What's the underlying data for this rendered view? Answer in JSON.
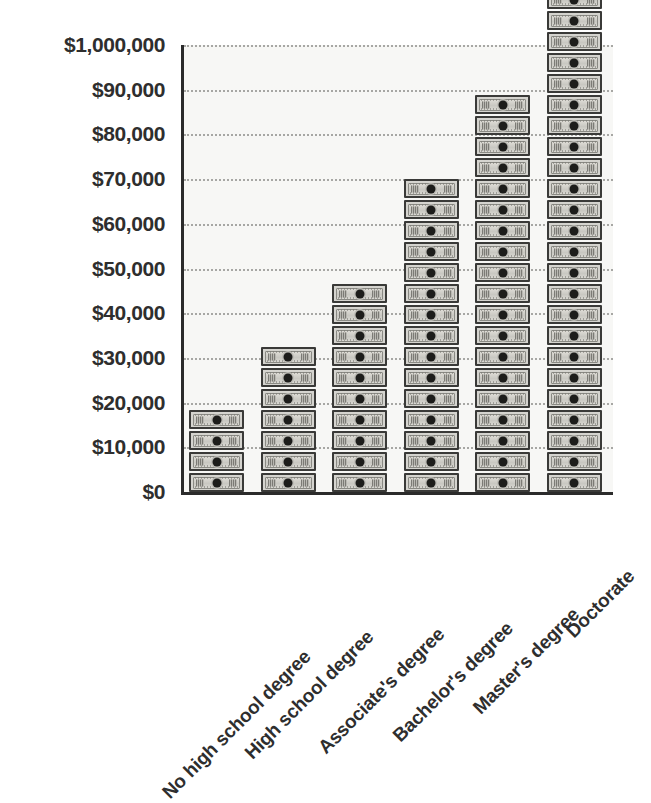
{
  "chart_data": {
    "type": "bar",
    "title": "",
    "subtitle": "",
    "xlabel": "",
    "ylabel": "",
    "categories": [
      "No high school degree",
      "High school degree",
      "Associate's degree",
      "Bachelor's degree",
      "Master's degree",
      "Doctorate"
    ],
    "values": [
      15000,
      25000,
      35000,
      52000,
      65000,
      90000
    ],
    "bill_counts": [
      4,
      7,
      10,
      15,
      19,
      26
    ],
    "ylim": [
      0,
      100000
    ],
    "ytick_values": [
      0,
      10000,
      20000,
      30000,
      40000,
      50000,
      60000,
      70000,
      80000,
      90000,
      100000
    ],
    "ytick_labels": [
      "$0",
      "$10,000",
      "$20,000",
      "$30,000",
      "$40,000",
      "$50,000",
      "$60,000",
      "$70,000",
      "$80,000",
      "$90,000",
      "$1,000,000"
    ],
    "grid": true,
    "grid_style": "dotted",
    "legend": false,
    "legend_position": "none",
    "bar_style": "pictogram-stacked-dollar-bills",
    "x_tick_rotation": -45,
    "annotations": []
  },
  "colors": {
    "plot_background": "#f7f7f5",
    "page_background": "#ffffff",
    "axis": "#2b2b2b",
    "gridline": "#9a9a96",
    "text": "#2e2e2e",
    "bill_fill": "#d5d4cf",
    "bill_border": "#3a3a38",
    "bill_portrait": "#1d1d1b"
  },
  "icons": {
    "bill": "dollar-bill-icon"
  }
}
